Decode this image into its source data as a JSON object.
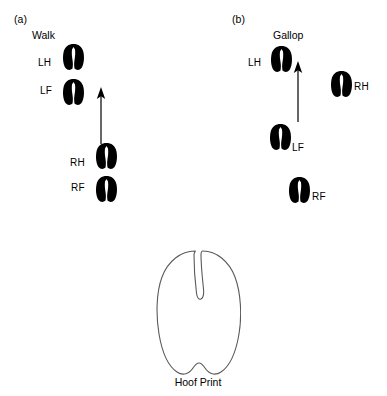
{
  "figure": {
    "background_color": "#ffffff",
    "ink_color": "#000000",
    "outline_stroke_color": "#5a5a5a"
  },
  "panels": [
    {
      "letter": "(a)",
      "letter_pos": {
        "x": 14,
        "y": 14
      },
      "title": "Walk",
      "title_pos": {
        "x": 32,
        "y": 30
      },
      "arrow": {
        "x": 100,
        "y": 88,
        "length": 54
      },
      "tracks": [
        {
          "id": "walk-lh",
          "label": "LH",
          "label_pos": {
            "x": 38,
            "y": 58
          },
          "hoof_pos": {
            "x": 62,
            "y": 43
          },
          "hoof_w": 23,
          "hoof_h": 28
        },
        {
          "id": "walk-lf",
          "label": "LF",
          "label_pos": {
            "x": 40,
            "y": 86
          },
          "hoof_pos": {
            "x": 62,
            "y": 78
          },
          "hoof_w": 23,
          "hoof_h": 28
        },
        {
          "id": "walk-rh",
          "label": "RH",
          "label_pos": {
            "x": 70,
            "y": 158
          },
          "hoof_pos": {
            "x": 95,
            "y": 142
          },
          "hoof_w": 23,
          "hoof_h": 28
        },
        {
          "id": "walk-rf",
          "label": "RF",
          "label_pos": {
            "x": 71,
            "y": 183
          },
          "hoof_pos": {
            "x": 95,
            "y": 175
          },
          "hoof_w": 23,
          "hoof_h": 28
        }
      ]
    },
    {
      "letter": "(b)",
      "letter_pos": {
        "x": 232,
        "y": 14
      },
      "title": "Gallop",
      "title_pos": {
        "x": 273,
        "y": 30
      },
      "arrow": {
        "x": 297,
        "y": 62,
        "length": 58
      },
      "tracks": [
        {
          "id": "gallop-lh",
          "label": "LH",
          "label_pos": {
            "x": 248,
            "y": 58
          },
          "hoof_pos": {
            "x": 270,
            "y": 45
          },
          "hoof_w": 23,
          "hoof_h": 28
        },
        {
          "id": "gallop-rh",
          "label": "RH",
          "label_pos": {
            "x": 354,
            "y": 82
          },
          "hoof_pos": {
            "x": 330,
            "y": 70
          },
          "hoof_w": 23,
          "hoof_h": 28
        },
        {
          "id": "gallop-lf",
          "label": "LF",
          "label_pos": {
            "x": 292,
            "y": 143
          },
          "hoof_pos": {
            "x": 269,
            "y": 123
          },
          "hoof_w": 23,
          "hoof_h": 28
        },
        {
          "id": "gallop-rf",
          "label": "RF",
          "label_pos": {
            "x": 312,
            "y": 192
          },
          "hoof_pos": {
            "x": 288,
            "y": 176
          },
          "hoof_w": 23,
          "hoof_h": 28
        }
      ]
    }
  ],
  "hoof_print": {
    "caption": "Hoof Print",
    "caption_pos": {
      "x": 148,
      "y": 377
    },
    "caption_width": 100,
    "pos": {
      "x": 155,
      "y": 246
    },
    "width": 86,
    "height": 132
  }
}
